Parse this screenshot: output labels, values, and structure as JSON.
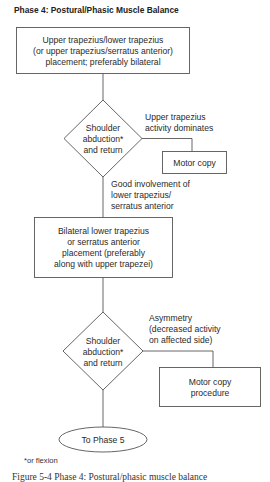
{
  "title": "Phase 4: Postural/Phasic Muscle Balance",
  "nodes": {
    "start_box": {
      "lines": [
        "Upper trapezius/lower trapezius",
        "(or upper trapezius/serratus anterior)",
        "placement; preferably bilateral"
      ]
    },
    "decision1": {
      "lines": [
        "Shoulder",
        "abduction*",
        "and return"
      ]
    },
    "motor_copy": {
      "lines": [
        "Motor copy"
      ]
    },
    "box2": {
      "lines": [
        "Bilateral lower trapezius",
        "or serratus anterior",
        "placement (preferably",
        "along with upper trapezei)"
      ]
    },
    "decision2": {
      "lines": [
        "Shoulder",
        "abduction*",
        "and return"
      ]
    },
    "motor_copy_procedure": {
      "lines": [
        "Motor copy",
        "procedure"
      ]
    },
    "end_oval": {
      "lines": [
        "To Phase 5"
      ]
    }
  },
  "edge_labels": {
    "d1_right": [
      "Upper trapezius",
      "activity dominates"
    ],
    "d1_down": [
      "Good involvement of",
      "lower trapezius/",
      "serratus anterior"
    ],
    "d2_right": [
      "Asymmetry",
      "(decreased activity",
      "on affected side)"
    ]
  },
  "footnote": "*or flexion",
  "caption": "Figure 5-4 Phase 4: Postural/phasic muscle balance"
}
